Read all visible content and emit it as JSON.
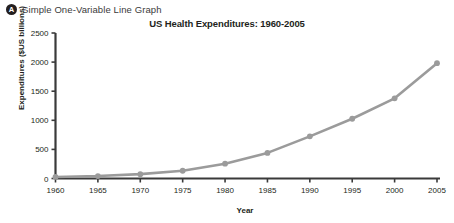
{
  "header": {
    "badge": "A",
    "title": "Simple One-Variable Line Graph"
  },
  "chart_data": {
    "type": "line",
    "title": "US Health Expenditures: 1960-2005",
    "xlabel": "Year",
    "ylabel": "Expenditures ($US billions)",
    "categories": [
      1960,
      1965,
      1970,
      1975,
      1980,
      1985,
      1990,
      1995,
      2000,
      2005
    ],
    "values": [
      27,
      42,
      75,
      133,
      255,
      440,
      724,
      1027,
      1378,
      1982
    ],
    "xtick_labels": [
      "1960",
      "1965",
      "1970",
      "1975",
      "1980",
      "1985",
      "1990",
      "1995",
      "2000",
      "2005"
    ],
    "ytick_labels": [
      "0",
      "500",
      "1000",
      "1500",
      "2000",
      "2500"
    ],
    "yticks": [
      0,
      500,
      1000,
      1500,
      2000,
      2500
    ],
    "xlim": [
      1960,
      2005
    ],
    "ylim": [
      0,
      2500
    ],
    "grid": false,
    "legend": false,
    "series_color": "#9b9b9b",
    "marker": "circle",
    "axis_color": "#3a3a3a"
  }
}
